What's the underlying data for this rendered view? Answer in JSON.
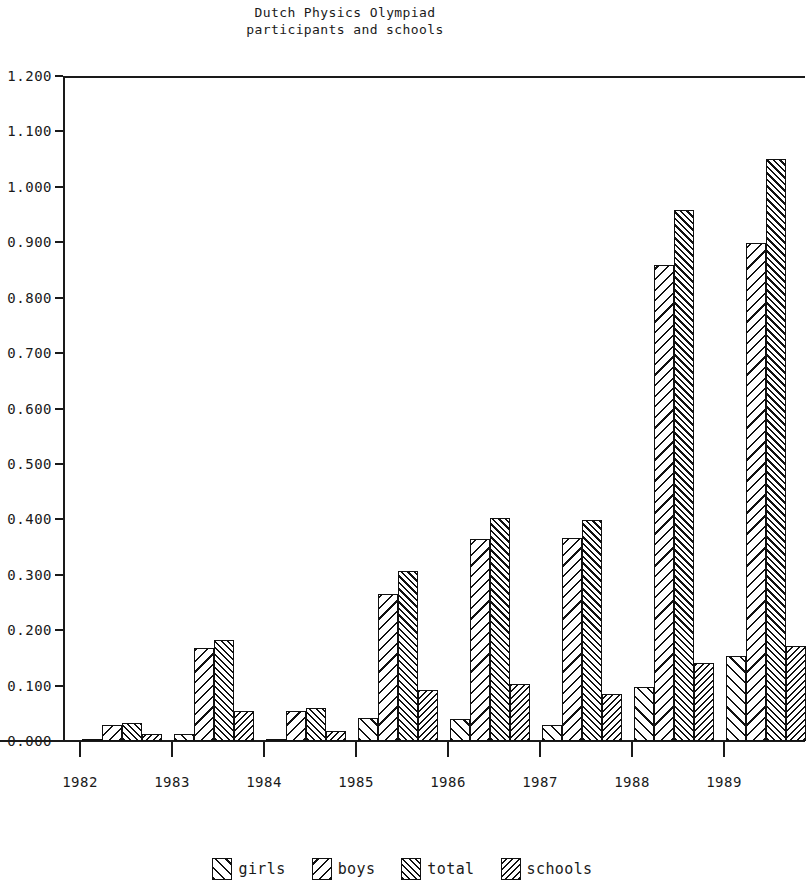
{
  "chart_data": {
    "type": "bar",
    "title": "Dutch Physics Olympiad",
    "subtitle": "participants and schools",
    "xlabel": "",
    "ylabel": "",
    "grid": false,
    "legend_position": "bottom",
    "ylim": [
      0.0,
      1.2
    ],
    "categories": [
      "1982",
      "1983",
      "1984",
      "1985",
      "1986",
      "1987",
      "1988",
      "1989"
    ],
    "ytick_labels": [
      "0.000",
      "0.100",
      "0.200",
      "0.300",
      "0.400",
      "0.500",
      "0.600",
      "0.700",
      "0.800",
      "0.900",
      "1.000",
      "1.100",
      "1.200"
    ],
    "ytick_values": [
      0.0,
      0.1,
      0.2,
      0.3,
      0.4,
      0.5,
      0.6,
      0.7,
      0.8,
      0.9,
      1.0,
      1.1,
      1.2
    ],
    "series": [
      {
        "name": "girls",
        "pattern": "forward-diagonal-sparse",
        "values": [
          0.002,
          0.012,
          0.003,
          0.042,
          0.04,
          0.028,
          0.097,
          0.153
        ]
      },
      {
        "name": "boys",
        "pattern": "back-diagonal-sparse",
        "values": [
          0.028,
          0.168,
          0.055,
          0.265,
          0.365,
          0.367,
          0.859,
          0.898
        ]
      },
      {
        "name": "total",
        "pattern": "forward-diagonal-dense",
        "values": [
          0.033,
          0.182,
          0.06,
          0.307,
          0.403,
          0.398,
          0.958,
          1.05
        ]
      },
      {
        "name": "schools",
        "pattern": "back-diagonal-dense",
        "values": [
          0.012,
          0.055,
          0.018,
          0.092,
          0.102,
          0.085,
          0.14,
          0.172
        ]
      }
    ]
  },
  "legend": {
    "items": [
      {
        "label": "girls"
      },
      {
        "label": "boys"
      },
      {
        "label": "total"
      },
      {
        "label": "schools"
      }
    ]
  },
  "colors": {
    "ink": "#111111",
    "background": "#ffffff"
  }
}
